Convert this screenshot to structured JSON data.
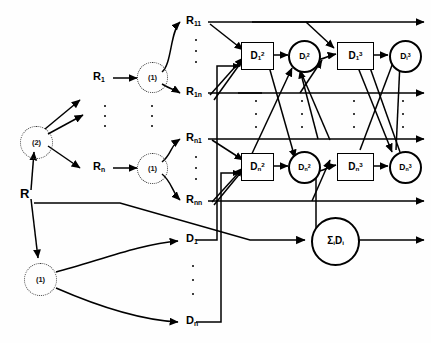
{
  "figure": {
    "kind": "hierarchical-network-flow-diagram",
    "ink_color": "#000000",
    "background": "#ffffff"
  },
  "root": {
    "label": "R"
  },
  "level_nodes": [
    {
      "id": "agg-2",
      "label": "(2)",
      "style": "dotted-circle"
    },
    {
      "id": "agg-1a",
      "label": "(1)",
      "style": "dotted-circle"
    },
    {
      "id": "agg-1b",
      "label": "(1)",
      "style": "dotted-circle"
    },
    {
      "id": "agg-1c",
      "label": "(1)",
      "style": "dotted-circle"
    }
  ],
  "r_mid": [
    {
      "id": "R1",
      "base": "R",
      "sub": "1"
    },
    {
      "id": "Rn",
      "base": "R",
      "sub": "n"
    }
  ],
  "r_leaf": [
    {
      "id": "R11",
      "base": "R",
      "sub": "11"
    },
    {
      "id": "R1n",
      "base": "R",
      "sub": "1n"
    },
    {
      "id": "Rn1",
      "base": "R",
      "sub": "n1"
    },
    {
      "id": "Rnn",
      "base": "R",
      "sub": "nn"
    }
  ],
  "d_leaf": [
    {
      "id": "D1",
      "base": "D",
      "sub": "1"
    },
    {
      "id": "Dn",
      "base": "D",
      "sub": "n"
    }
  ],
  "d_boxes": [
    {
      "id": "D1_2",
      "base": "D",
      "sub": "1",
      "sup": "2"
    },
    {
      "id": "D1_3",
      "base": "D",
      "sub": "1",
      "sup": "3"
    },
    {
      "id": "Dn_2",
      "base": "D",
      "sub": "n",
      "sup": "2"
    },
    {
      "id": "Dn_3",
      "base": "D",
      "sub": "n",
      "sup": "3"
    }
  ],
  "d_circles": [
    {
      "id": "Di_2c",
      "base": "D",
      "sub": "i",
      "sup": "2"
    },
    {
      "id": "Di_3c",
      "base": "D",
      "sub": "i",
      "sup": "3"
    },
    {
      "id": "Dn_2c",
      "base": "D",
      "sub": "n",
      "sup": "2"
    },
    {
      "id": "Dn_3c",
      "base": "D",
      "sub": "n",
      "sup": "3"
    }
  ],
  "sum_node": {
    "id": "sum",
    "sigma": "Σ",
    "sub": "i",
    "base": "D",
    "sub2": "i"
  },
  "ellipses": [
    {
      "id": "dots-r-mid",
      "count": 3
    },
    {
      "id": "dots-agg-mid",
      "count": 3
    },
    {
      "id": "dots-r11-r1n",
      "count": 3
    },
    {
      "id": "dots-rn1-rnn",
      "count": 3
    },
    {
      "id": "dots-col-d1box",
      "count": 3
    },
    {
      "id": "dots-col-d1circ",
      "count": 3
    },
    {
      "id": "dots-col-d3box",
      "count": 3
    },
    {
      "id": "dots-col-d3circ",
      "count": 3
    },
    {
      "id": "dots-d1-dn",
      "count": 3
    }
  ]
}
